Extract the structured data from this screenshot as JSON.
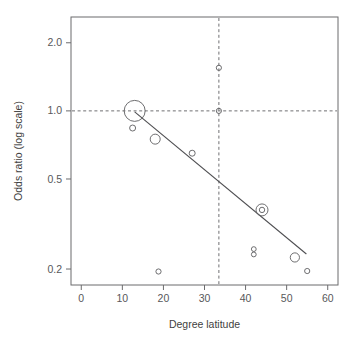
{
  "chart_data": {
    "type": "scatter",
    "title": "",
    "xlabel": "Degree latitude",
    "ylabel": "Odds ratio (log scale)",
    "yscale": "log",
    "xlim": [
      -2.5,
      62.5
    ],
    "ylim": [
      0.17,
      2.6
    ],
    "grid": false,
    "legend": null,
    "xticks": [
      0,
      10,
      20,
      30,
      40,
      50,
      60
    ],
    "xtick_labels": [
      "0",
      "10",
      "20",
      "30",
      "40",
      "50",
      "60"
    ],
    "yticks": [
      0.2,
      0.5,
      1.0,
      2.0
    ],
    "ytick_labels": [
      "0.2",
      "0.5",
      "1.0",
      "2.0"
    ],
    "points": [
      {
        "x": 13.0,
        "y": 1.0,
        "size": 10.5,
        "double_ring": false
      },
      {
        "x": 12.5,
        "y": 0.84,
        "size": 3.0,
        "double_ring": false
      },
      {
        "x": 18.0,
        "y": 0.75,
        "size": 5.0,
        "double_ring": false
      },
      {
        "x": 18.8,
        "y": 0.195,
        "size": 2.6,
        "double_ring": false
      },
      {
        "x": 27.0,
        "y": 0.65,
        "size": 3.0,
        "double_ring": false
      },
      {
        "x": 33.5,
        "y": 1.55,
        "size": 2.6,
        "double_ring": false
      },
      {
        "x": 33.5,
        "y": 1.0,
        "size": 2.6,
        "double_ring": false
      },
      {
        "x": 42.0,
        "y": 0.245,
        "size": 2.4,
        "double_ring": false
      },
      {
        "x": 42.0,
        "y": 0.232,
        "size": 2.4,
        "double_ring": false
      },
      {
        "x": 44.0,
        "y": 0.365,
        "size": 6.0,
        "double_ring": true
      },
      {
        "x": 52.0,
        "y": 0.225,
        "size": 4.6,
        "double_ring": false
      },
      {
        "x": 55.0,
        "y": 0.196,
        "size": 2.6,
        "double_ring": false
      }
    ],
    "regression_line": {
      "x_start": 13.0,
      "y_start": 0.99,
      "x_end": 54.8,
      "y_end": 0.233
    },
    "reference_lines": [
      {
        "orientation": "horizontal",
        "value": 1.0,
        "style": "dashed"
      },
      {
        "orientation": "vertical",
        "value": 33.5,
        "style": "dashed"
      }
    ],
    "colors": {
      "axis": "#6b6b6d",
      "marker": "#5d5d60",
      "regression": "#4e4e51",
      "reference": "#6f6f72",
      "text": "#45454a",
      "background": "#ffffff"
    }
  },
  "axes": {
    "x_title": "Degree latitude",
    "y_title": "Odds ratio (log scale)"
  }
}
